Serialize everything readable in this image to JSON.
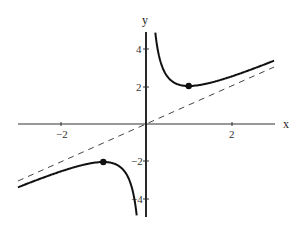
{
  "chart_data": {
    "type": "line",
    "title": "",
    "function": "y = x + 1/x",
    "xlabel": "x",
    "ylabel": "y",
    "xlim": [
      -3.0,
      3.0
    ],
    "ylim": [
      -5.0,
      5.0
    ],
    "x_ticks": [
      -2,
      2
    ],
    "x_tick_labels": [
      "−2",
      "2"
    ],
    "y_ticks": [
      -4,
      -2,
      2,
      4
    ],
    "y_tick_labels": [
      "−4",
      "−2",
      "2",
      "4"
    ],
    "grid": false,
    "legend": null,
    "series": [
      {
        "name": "y = x + 1/x (x>0 branch)",
        "style": "solid",
        "color": "#111111",
        "x": [
          0.19,
          0.25,
          0.33,
          0.5,
          0.75,
          1.0,
          1.5,
          2.0,
          2.5,
          3.0
        ],
        "y": [
          5.45,
          4.25,
          3.36,
          2.5,
          2.08,
          2.0,
          2.17,
          2.5,
          2.9,
          3.33
        ]
      },
      {
        "name": "y = x + 1/x (x<0 branch)",
        "style": "solid",
        "color": "#111111",
        "x": [
          -3.0,
          -2.5,
          -2.0,
          -1.5,
          -1.0,
          -0.75,
          -0.5,
          -0.33,
          -0.25,
          -0.19
        ],
        "y": [
          -3.33,
          -2.9,
          -2.5,
          -2.17,
          -2.0,
          -2.08,
          -2.5,
          -3.36,
          -4.25,
          -5.45
        ]
      },
      {
        "name": "asymptote y = x",
        "style": "dashed",
        "color": "#444444",
        "x": [
          -3.0,
          3.0
        ],
        "y": [
          -3.0,
          3.0
        ]
      }
    ],
    "points": [
      {
        "label": "local minimum",
        "x": 1,
        "y": 2
      },
      {
        "label": "local maximum",
        "x": -1,
        "y": -2
      }
    ],
    "annotations": [
      "vertical asymptote at x = 0 (y-axis)"
    ]
  },
  "labels": {
    "x_axis": "x",
    "y_axis": "y",
    "xt_m2": "−2",
    "xt_2": "2",
    "yt_4": "4",
    "yt_2": "2",
    "yt_m2": "−2",
    "yt_m4": "−4"
  }
}
